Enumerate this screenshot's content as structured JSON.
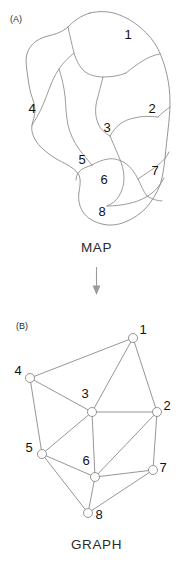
{
  "figure": {
    "panels": [
      {
        "id": "A",
        "label": "(A)",
        "caption": "MAP"
      },
      {
        "id": "B",
        "label": "(B)",
        "caption": "GRAPH"
      }
    ],
    "arrow": {
      "name": "down-arrow-icon",
      "direction": "down"
    },
    "colors": {
      "stroke": "#8a8a8a",
      "text": "#111111",
      "background": "#ffffff",
      "arrow": "#9a9a9a"
    }
  },
  "map": {
    "caption": "MAP",
    "panel_label": "(A)",
    "regions": [
      {
        "id": "1",
        "label": "1",
        "label_x": 128,
        "label_y": 39
      },
      {
        "id": "2",
        "label": "2",
        "label_x": 152,
        "label_y": 113
      },
      {
        "id": "3",
        "label": "3",
        "label_x": 107,
        "label_y": 132
      },
      {
        "id": "4",
        "label": "4",
        "label_x": 32,
        "label_y": 113
      },
      {
        "id": "5",
        "label": "5",
        "label_x": 82,
        "label_y": 164
      },
      {
        "id": "6",
        "label": "6",
        "label_x": 104,
        "label_y": 184
      },
      {
        "id": "7",
        "label": "7",
        "label_x": 155,
        "label_y": 175
      },
      {
        "id": "8",
        "label": "8",
        "label_x": 102,
        "label_y": 216
      }
    ],
    "outline": "M 90 13 C 80 16 74 21 68 27 C 62 32 56 34 48 36 C 40 38 33 42 29 49 C 25 56 26 63 27 71 C 28 79 29 87 31 94 C 33 100 35 105 35 111 C 35 116 33 120 32 125 C 31 131 33 136 36 141 C 39 146 44 150 49 154 C 54 158 60 161 66 164 C 71 167 76 170 79 175 C 81 180 80 186 79 192 C 78 199 79 206 83 212 C 87 218 94 222 102 224 C 110 226 118 225 125 222 C 133 219 140 214 146 208 C 152 201 157 193 160 185 C 163 176 164 167 165 158 C 166 148 167 139 168 130 C 169 121 170 112 170 103 C 170 93 169 84 167 75 C 165 66 162 57 158 49 C 154 41 148 34 141 28 C 134 22 126 17 117 14 C 108 11 99 11 90 13 Z",
    "internal_borders": [
      "M 68 27 C 70 36 72 45 74 53 C 76 60 79 66 84 71 C 89 75 96 77 103 77 C 111 77 119 76 126 73",
      "M 126 73 C 131 69 136 65 141 62 C 147 58 153 55 160 54",
      "M 103 77 C 101 85 99 93 97 100 C 95 108 95 116 98 123 C 100 129 105 133 110 136",
      "M 110 136 C 113 131 116 127 120 124 C 124 121 129 119 134 118 C 142 116 150 116 158 117",
      "M 158 117 C 162 113 166 110 170 107",
      "M 74 53 C 68 58 63 63 59 69 C 54 76 51 84 48 92 C 45 100 42 108 38 115 C 36 119 34 122 32 125",
      "M 59 69 C 62 78 64 87 65 96 C 66 106 66 116 68 125 C 70 134 74 142 79 149 C 83 155 88 160 92 165",
      "M 92 165 C 87 167 82 168 79 172 C 77 174 76 177 76 180",
      "M 92 165 C 97 162 102 160 108 159 C 114 158 120 160 125 163 C 131 167 135 173 138 179 C 141 185 143 191 147 196",
      "M 110 136 C 113 143 116 150 119 157 C 122 164 124 171 124 178 C 124 185 122 191 119 196 C 116 201 112 204 107 206",
      "M 107 206 C 115 206 123 205 131 203 C 139 201 146 198 152 193 C 157 189 161 184 164 178",
      "M 138 179 C 145 174 152 170 158 165 C 163 161 167 157 169 152",
      "M 147 196 C 152 199 157 201 162 201"
    ]
  },
  "graph": {
    "caption": "GRAPH",
    "panel_label": "(B)",
    "nodes": [
      {
        "id": "1",
        "label": "1",
        "x": 133,
        "y": 338,
        "label_x": 143,
        "label_y": 334
      },
      {
        "id": "2",
        "label": "2",
        "x": 157,
        "y": 412,
        "label_x": 167,
        "label_y": 410
      },
      {
        "id": "3",
        "label": "3",
        "x": 92,
        "y": 412,
        "label_x": 85,
        "label_y": 398
      },
      {
        "id": "4",
        "label": "4",
        "x": 30,
        "y": 378,
        "label_x": 18,
        "label_y": 375
      },
      {
        "id": "5",
        "label": "5",
        "x": 42,
        "y": 454,
        "label_x": 29,
        "label_y": 452
      },
      {
        "id": "6",
        "label": "6",
        "x": 95,
        "y": 477,
        "label_x": 86,
        "label_y": 465
      },
      {
        "id": "7",
        "label": "7",
        "x": 153,
        "y": 470,
        "label_x": 163,
        "label_y": 472
      },
      {
        "id": "8",
        "label": "8",
        "x": 88,
        "y": 513,
        "label_x": 99,
        "label_y": 519
      }
    ],
    "edges": [
      {
        "from": "1",
        "to": "2"
      },
      {
        "from": "1",
        "to": "3"
      },
      {
        "from": "1",
        "to": "4"
      },
      {
        "from": "2",
        "to": "3"
      },
      {
        "from": "2",
        "to": "6"
      },
      {
        "from": "2",
        "to": "7"
      },
      {
        "from": "3",
        "to": "4"
      },
      {
        "from": "3",
        "to": "5"
      },
      {
        "from": "3",
        "to": "6"
      },
      {
        "from": "4",
        "to": "5"
      },
      {
        "from": "5",
        "to": "6"
      },
      {
        "from": "5",
        "to": "8"
      },
      {
        "from": "6",
        "to": "7"
      },
      {
        "from": "6",
        "to": "8"
      },
      {
        "from": "7",
        "to": "8"
      }
    ],
    "node_radius": 4.5
  }
}
